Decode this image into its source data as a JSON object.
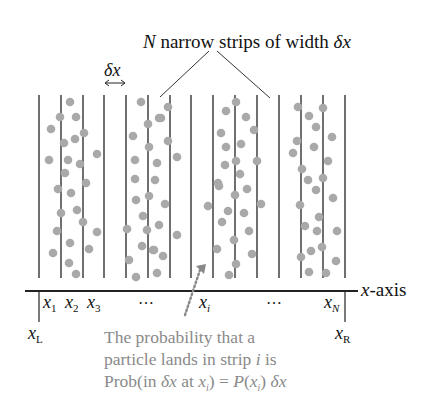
{
  "title_label": {
    "n": "N",
    "text": " narrow strips of width ",
    "delta": "δ",
    "x": "x"
  },
  "width_marker": {
    "delta": "δ",
    "x": "x",
    "arrow": "↔"
  },
  "axis": {
    "label_var": "x",
    "label_text": "-axis",
    "left_label": "x",
    "left_sub": "L",
    "right_label": "x",
    "right_sub": "R",
    "ticks": [
      {
        "var": "x",
        "sub": "1"
      },
      {
        "var": "x",
        "sub": "2"
      },
      {
        "var": "x",
        "sub": "3"
      },
      {
        "text": "…"
      },
      {
        "var": "x",
        "sub": "i"
      },
      {
        "text": "…"
      },
      {
        "var": "x",
        "sub": "N"
      }
    ]
  },
  "caption": {
    "line1": "The probability that a",
    "line2_a": "particle lands in strip ",
    "line2_i": "i",
    "line2_b": " is",
    "line3_a": "Prob(in ",
    "line3_delta": "δ",
    "line3_x": "x",
    "line3_b": " at ",
    "line3_xi": "x",
    "line3_sub": "i",
    "line3_c": ") = ",
    "line3_P": "P",
    "line3_d": "(",
    "line3_xi2": "x",
    "line3_sub2": "i",
    "line3_e": ") ",
    "line3_delta2": "δ",
    "line3_x2": "x"
  },
  "colors": {
    "line": "#222222",
    "dot": "#a9a9a9",
    "caption": "#8a8a8a",
    "arrow": "#888888"
  },
  "strips": {
    "line_xs": [
      39,
      61,
      83,
      104,
      126,
      148,
      170,
      191,
      213,
      235,
      257,
      279,
      301,
      323,
      345
    ],
    "top": 95,
    "bottom": 278
  },
  "dots": [
    [
      70,
      102
    ],
    [
      60,
      117
    ],
    [
      76,
      117
    ],
    [
      51,
      129
    ],
    [
      84,
      133
    ],
    [
      64,
      143
    ],
    [
      75,
      139
    ],
    [
      49,
      160
    ],
    [
      68,
      160
    ],
    [
      80,
      164
    ],
    [
      97,
      154
    ],
    [
      65,
      173
    ],
    [
      86,
      183
    ],
    [
      58,
      189
    ],
    [
      71,
      193
    ],
    [
      61,
      213
    ],
    [
      77,
      210
    ],
    [
      83,
      222
    ],
    [
      57,
      231
    ],
    [
      97,
      232
    ],
    [
      70,
      243
    ],
    [
      53,
      253
    ],
    [
      89,
      249
    ],
    [
      69,
      263
    ],
    [
      76,
      274
    ],
    [
      141,
      102
    ],
    [
      148,
      124
    ],
    [
      159,
      118
    ],
    [
      133,
      136
    ],
    [
      149,
      147
    ],
    [
      135,
      160
    ],
    [
      157,
      163
    ],
    [
      135,
      179
    ],
    [
      155,
      180
    ],
    [
      136,
      200
    ],
    [
      149,
      196
    ],
    [
      143,
      216
    ],
    [
      127,
      229
    ],
    [
      147,
      230
    ],
    [
      142,
      246
    ],
    [
      153,
      250
    ],
    [
      129,
      260
    ],
    [
      136,
      277
    ],
    [
      157,
      273
    ],
    [
      168,
      107
    ],
    [
      161,
      118
    ],
    [
      168,
      141
    ],
    [
      177,
      157
    ],
    [
      165,
      204
    ],
    [
      159,
      225
    ],
    [
      177,
      235
    ],
    [
      154,
      250
    ],
    [
      163,
      256
    ],
    [
      236,
      102
    ],
    [
      226,
      111
    ],
    [
      246,
      117
    ],
    [
      221,
      133
    ],
    [
      254,
      130
    ],
    [
      226,
      147
    ],
    [
      241,
      144
    ],
    [
      225,
      165
    ],
    [
      236,
      161
    ],
    [
      257,
      161
    ],
    [
      240,
      174
    ],
    [
      218,
      183
    ],
    [
      219,
      186
    ],
    [
      235,
      195
    ],
    [
      247,
      189
    ],
    [
      208,
      206
    ],
    [
      228,
      211
    ],
    [
      244,
      213
    ],
    [
      261,
      204
    ],
    [
      222,
      222
    ],
    [
      249,
      231
    ],
    [
      234,
      240
    ],
    [
      217,
      249
    ],
    [
      252,
      254
    ],
    [
      236,
      264
    ],
    [
      229,
      275
    ],
    [
      298,
      107
    ],
    [
      323,
      108
    ],
    [
      309,
      116
    ],
    [
      316,
      127
    ],
    [
      332,
      137
    ],
    [
      297,
      141
    ],
    [
      314,
      147
    ],
    [
      293,
      153
    ],
    [
      328,
      161
    ],
    [
      302,
      169
    ],
    [
      308,
      180
    ],
    [
      323,
      178
    ],
    [
      316,
      190
    ],
    [
      333,
      198
    ],
    [
      300,
      205
    ],
    [
      319,
      217
    ],
    [
      305,
      226
    ],
    [
      317,
      231
    ],
    [
      337,
      231
    ],
    [
      311,
      251
    ],
    [
      322,
      247
    ],
    [
      301,
      257
    ],
    [
      336,
      261
    ],
    [
      309,
      272
    ],
    [
      326,
      273
    ]
  ]
}
